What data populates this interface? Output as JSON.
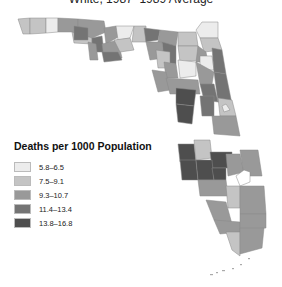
{
  "title": "White, 1987–1989 Average",
  "legend": {
    "title": "Deaths per 1000 Population",
    "items": [
      {
        "label": "5.8–6.5",
        "color": "#ececec"
      },
      {
        "label": "7.5–9.1",
        "color": "#c4c4c4"
      },
      {
        "label": "9.3–10.7",
        "color": "#999999"
      },
      {
        "label": "11.4–13.4",
        "color": "#747474"
      },
      {
        "label": "13.8–16.8",
        "color": "#4e4e4e"
      }
    ]
  },
  "map": {
    "region": "Florida",
    "unit": "counties",
    "shade_classes": 5
  }
}
